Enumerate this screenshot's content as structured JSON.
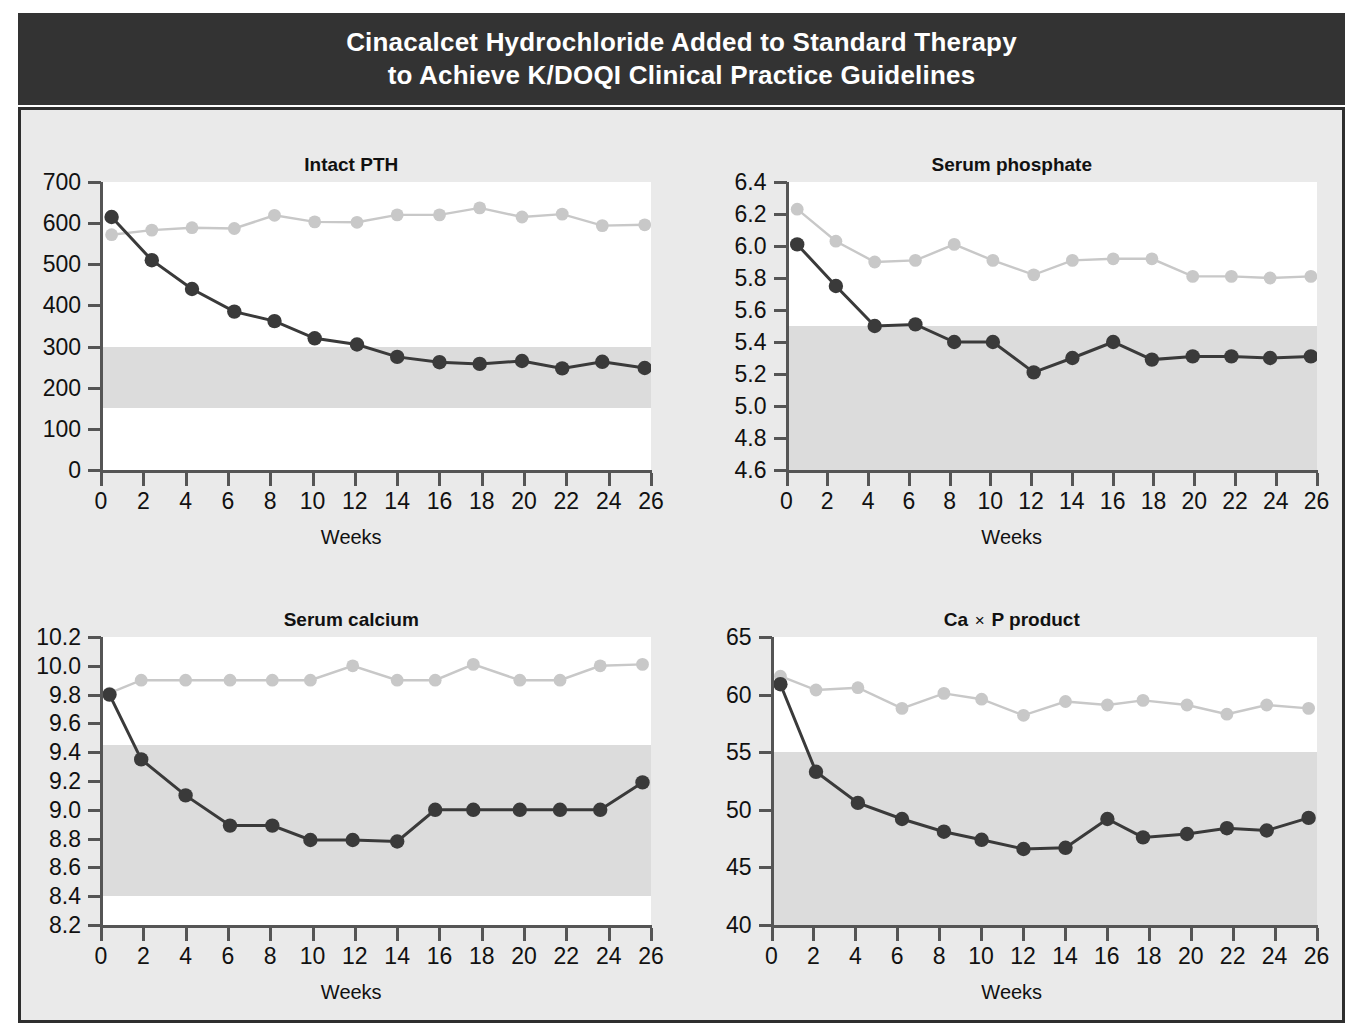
{
  "header": {
    "line1": "Cinacalcet Hydrochloride Added to Standard Therapy",
    "line2": "to Achieve K/DOQI Clinical Practice Guidelines",
    "background": "#333333",
    "text_color": "#ffffff"
  },
  "palette": {
    "page_background": "#ffffff",
    "panel_background": "#eaeaea",
    "panel_border": "#2e2e2e",
    "plot_background": "#ffffff",
    "target_band": "#dcdcdc",
    "axis": "#555555",
    "series_cinacalcet": "#3a3a3a",
    "series_control": "#c8c8c8"
  },
  "legend_note": {
    "series_dark": "Cinacalcet",
    "series_light": "Control"
  },
  "chart_data": [
    {
      "type": "line",
      "title": "Intact PTH",
      "xlabel": "Weeks",
      "ylabel": "",
      "xlim": [
        0,
        26
      ],
      "ylim": [
        0,
        700
      ],
      "xticks": [
        0,
        2,
        4,
        6,
        8,
        10,
        12,
        14,
        16,
        18,
        20,
        22,
        24,
        26
      ],
      "yticks": [
        0,
        100,
        200,
        300,
        400,
        500,
        600,
        700
      ],
      "ytick_labels": [
        "0",
        "100",
        "200",
        "300",
        "400",
        "500",
        "600",
        "700"
      ],
      "grid": false,
      "legend": "none",
      "target_band": [
        150,
        300
      ],
      "x": [
        0.5,
        2.4,
        4.3,
        6.3,
        8.2,
        10.1,
        12.1,
        14.0,
        16.0,
        17.9,
        19.9,
        21.8,
        23.7,
        25.7
      ],
      "series": [
        {
          "name": "Cinacalcet",
          "color": "#3a3a3a",
          "values": [
            615,
            510,
            440,
            385,
            362,
            320,
            305,
            275,
            262,
            258,
            265,
            247,
            263,
            248
          ]
        },
        {
          "name": "Control",
          "color": "#c8c8c8",
          "values": [
            572,
            583,
            589,
            587,
            619,
            603,
            602,
            620,
            620,
            637,
            615,
            622,
            594,
            596
          ]
        }
      ]
    },
    {
      "type": "line",
      "title": "Serum phosphate",
      "xlabel": "Weeks",
      "ylabel": "",
      "xlim": [
        0,
        26
      ],
      "ylim": [
        4.6,
        6.4
      ],
      "xticks": [
        0,
        2,
        4,
        6,
        8,
        10,
        12,
        14,
        16,
        18,
        20,
        22,
        24,
        26
      ],
      "yticks": [
        4.6,
        4.8,
        5.0,
        5.2,
        5.4,
        5.6,
        5.8,
        6.0,
        6.2,
        6.4
      ],
      "ytick_labels": [
        "4.6",
        "4.8",
        "5.0",
        "5.2",
        "5.4",
        "5.6",
        "5.8",
        "6.0",
        "6.2",
        "6.4"
      ],
      "grid": false,
      "legend": "none",
      "target_band": [
        4.6,
        5.5
      ],
      "x": [
        0.5,
        2.4,
        4.3,
        6.3,
        8.2,
        10.1,
        12.1,
        14.0,
        16.0,
        17.9,
        19.9,
        21.8,
        23.7,
        25.7
      ],
      "series": [
        {
          "name": "Cinacalcet",
          "color": "#3a3a3a",
          "values": [
            6.01,
            5.75,
            5.5,
            5.51,
            5.4,
            5.4,
            5.21,
            5.3,
            5.4,
            5.29,
            5.31,
            5.31,
            5.3,
            5.31
          ]
        },
        {
          "name": "Control",
          "color": "#c8c8c8",
          "values": [
            6.23,
            6.03,
            5.9,
            5.91,
            6.01,
            5.91,
            5.82,
            5.91,
            5.92,
            5.92,
            5.81,
            5.81,
            5.8,
            5.81
          ]
        }
      ]
    },
    {
      "type": "line",
      "title": "Serum calcium",
      "xlabel": "Weeks",
      "ylabel": "",
      "xlim": [
        0,
        26
      ],
      "ylim": [
        8.2,
        10.2
      ],
      "xticks": [
        0,
        2,
        4,
        6,
        8,
        10,
        12,
        14,
        16,
        18,
        20,
        22,
        24,
        26
      ],
      "yticks": [
        8.2,
        8.4,
        8.6,
        8.8,
        9.0,
        9.2,
        9.4,
        9.6,
        9.8,
        10.0,
        10.2
      ],
      "ytick_labels": [
        "8.2",
        "8.4",
        "8.6",
        "8.8",
        "9.0",
        "9.2",
        "9.4",
        "9.6",
        "9.8",
        "10.0",
        "10.2"
      ],
      "grid": false,
      "legend": "none",
      "target_band": [
        8.4,
        9.45
      ],
      "x": [
        0.4,
        1.9,
        4.0,
        6.1,
        8.1,
        9.9,
        11.9,
        14.0,
        15.8,
        17.6,
        19.8,
        21.7,
        23.6,
        25.6
      ],
      "series": [
        {
          "name": "Cinacalcet",
          "color": "#3a3a3a",
          "values": [
            9.8,
            9.35,
            9.1,
            8.89,
            8.89,
            8.79,
            8.79,
            8.78,
            9.0,
            9.0,
            9.0,
            9.0,
            9.0,
            9.19
          ]
        },
        {
          "name": "Control",
          "color": "#c8c8c8",
          "values": [
            9.81,
            9.9,
            9.9,
            9.9,
            9.9,
            9.9,
            10.0,
            9.9,
            9.9,
            10.01,
            9.9,
            9.9,
            10.0,
            10.01
          ]
        }
      ]
    },
    {
      "type": "line",
      "title": "Ca × P product",
      "title_parts": {
        "prefix": "Ca",
        "operator": "×",
        "suffix": "P product"
      },
      "xlabel": "Weeks",
      "ylabel": "",
      "xlim": [
        0,
        26
      ],
      "ylim": [
        40,
        65
      ],
      "xticks": [
        0,
        2,
        4,
        6,
        8,
        10,
        12,
        14,
        16,
        18,
        20,
        22,
        24,
        26
      ],
      "yticks": [
        40,
        45,
        50,
        55,
        60,
        65
      ],
      "ytick_labels": [
        "40",
        "45",
        "50",
        "55",
        "60",
        "65"
      ],
      "grid": false,
      "legend": "none",
      "target_band": [
        40,
        55
      ],
      "x": [
        0.4,
        2.1,
        4.1,
        6.2,
        8.2,
        10.0,
        12.0,
        14.0,
        16.0,
        17.7,
        19.8,
        21.7,
        23.6,
        25.6
      ],
      "series": [
        {
          "name": "Cinacalcet",
          "color": "#3a3a3a",
          "values": [
            60.9,
            53.3,
            50.6,
            49.2,
            48.1,
            47.4,
            46.6,
            46.7,
            49.2,
            47.6,
            47.9,
            48.4,
            48.2,
            49.3
          ]
        },
        {
          "name": "Control",
          "color": "#c8c8c8",
          "values": [
            61.6,
            60.4,
            60.6,
            58.8,
            60.1,
            59.6,
            58.2,
            59.4,
            59.1,
            59.5,
            59.1,
            58.3,
            59.1,
            58.8
          ]
        }
      ]
    }
  ]
}
